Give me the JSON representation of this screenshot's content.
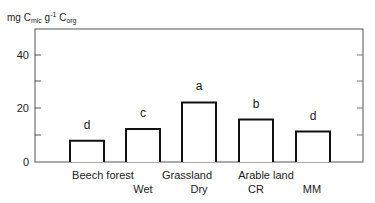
{
  "chart_data": {
    "type": "bar",
    "title": "",
    "ylabel": "mg C_mic g^-1 C_org",
    "ylabel_parts": {
      "base1": "mg C",
      "sub1": "mic",
      "mid": " g",
      "sup": "-1",
      "base2": " C",
      "sub2": "org"
    },
    "xlabel": "",
    "ylim": [
      0,
      48
    ],
    "yticks": [
      0,
      20,
      40
    ],
    "ytick_labels": [
      "0",
      "20",
      "40"
    ],
    "minor_yticks": [
      10,
      30
    ],
    "grid": false,
    "categories": [
      "Beech forest",
      "Grassland Wet",
      "Grassland Dry",
      "Arable land CR",
      "Arable land MM"
    ],
    "values": [
      8,
      12.5,
      22.5,
      16,
      11.5
    ],
    "significance_letters": [
      "d",
      "c",
      "a",
      "b",
      "d"
    ],
    "group_labels": [
      {
        "label": "Beech forest",
        "sub": [
          ""
        ]
      },
      {
        "label": "Grassland",
        "sub": [
          "Wet",
          "Dry"
        ]
      },
      {
        "label": "Arable land",
        "sub": [
          "CR",
          "MM"
        ]
      }
    ],
    "x_sub_labels": [
      "Wet",
      "Dry",
      "CR",
      "MM"
    ]
  }
}
